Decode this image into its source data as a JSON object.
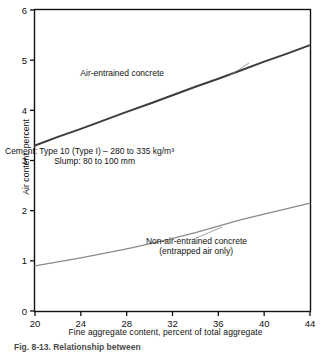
{
  "chart_data": {
    "type": "line",
    "title": "",
    "xlabel": "Fine aggregate content, percent of total aggregate",
    "ylabel": "Air content, percent",
    "xlim": [
      20,
      44
    ],
    "ylim": [
      0,
      6
    ],
    "xticks": [
      20,
      24,
      28,
      32,
      36,
      40,
      44
    ],
    "yticks": [
      0,
      1,
      2,
      3,
      4,
      5,
      6
    ],
    "grid": false,
    "legend": "inline-annotations",
    "series": [
      {
        "name": "Air-entrained concrete",
        "color": "#3d3d3d",
        "width": 2.0,
        "x": [
          20,
          22,
          24,
          26,
          28,
          30,
          32,
          34,
          36,
          38,
          40,
          42,
          44
        ],
        "values": [
          3.3,
          3.47,
          3.63,
          3.8,
          3.97,
          4.13,
          4.3,
          4.47,
          4.63,
          4.8,
          4.97,
          5.13,
          5.3
        ]
      },
      {
        "name": "Non-air-entrained concrete (entrapped air only)",
        "color": "#8a8a8a",
        "width": 1.3,
        "x": [
          20,
          22,
          24,
          26,
          28,
          30,
          32,
          34,
          36,
          38,
          40,
          42,
          44
        ],
        "values": [
          0.9,
          0.98,
          1.06,
          1.15,
          1.24,
          1.34,
          1.45,
          1.56,
          1.69,
          1.82,
          1.93,
          2.04,
          2.15
        ]
      }
    ],
    "annotations": [
      {
        "name": "air-entrained-label",
        "text": "Air-entrained concrete",
        "x": 164,
        "y": 76
      },
      {
        "name": "conditions-line-1",
        "text": "Cement: Type 10 (Type I) – 280 to 335 kg/m³",
        "x": 174,
        "y": 154
      },
      {
        "name": "conditions-line-2",
        "text": "Slump: 80 to 100 mm",
        "x": 135,
        "y": 164
      },
      {
        "name": "non-air-entrained-label-line-1",
        "text": "Non-air-entrained concrete",
        "x": 247,
        "y": 244
      },
      {
        "name": "non-air-entrained-label-line-2",
        "text": "(entrapped air only)",
        "x": 233,
        "y": 254
      }
    ],
    "leader_lines": [
      {
        "name": "air-entrained-leader",
        "x1": 229,
        "y1": 76,
        "x2": 249,
        "y2": 63
      },
      {
        "name": "non-air-entrained-leader",
        "x1": 194,
        "y1": 239,
        "x2": 222,
        "y2": 227
      }
    ]
  },
  "figure": {
    "caption": "Fig. 8-13. Relationship between"
  }
}
